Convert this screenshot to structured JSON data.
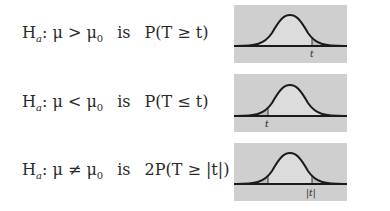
{
  "rows": [
    {
      "hypothesis_label": "H",
      "hypothesis_sub": "a",
      "hypothesis_rel": ": μ > μ",
      "hypothesis_sub2": "0",
      "connector": "is",
      "pvalue": "P(T ≥ t)",
      "diagram": {
        "type": "right-tail",
        "marker_label": "t"
      }
    },
    {
      "hypothesis_label": "H",
      "hypothesis_sub": "a",
      "hypothesis_rel": ": μ < μ",
      "hypothesis_sub2": "0",
      "connector": "is",
      "pvalue": "P(T ≤ t)",
      "diagram": {
        "type": "left-tail",
        "marker_label": "t"
      }
    },
    {
      "hypothesis_label": "H",
      "hypothesis_sub": "a",
      "hypothesis_rel": ": μ ≠ μ",
      "hypothesis_sub2": "0",
      "connector": "is",
      "pvalue": "2P(T ≥ |t|)",
      "diagram": {
        "type": "two-tail",
        "marker_label": "|t|"
      }
    }
  ],
  "colors": {
    "panel_bg": "#cfcfcf",
    "under_curve": "#dcdcdc",
    "tail_fill": "#bdbdbd",
    "curve": "#1a1a1a"
  }
}
